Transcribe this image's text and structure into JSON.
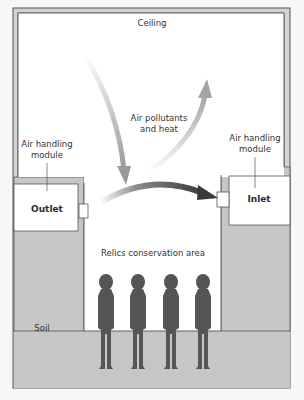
{
  "diagram": {
    "type": "cross-section",
    "labels": {
      "ceiling": "Ceiling",
      "air_flow": [
        "Air pollutants",
        "and heat"
      ],
      "left_module": [
        "Air handling",
        "module"
      ],
      "right_module": [
        "Air handling",
        "module"
      ],
      "outlet": "Outlet",
      "inlet": "Inlet",
      "conservation_area": "Relics conservation area",
      "soil": "Soil"
    },
    "figures_count": 4,
    "colors": {
      "background": "#f7f7f5",
      "soil": "#c6c6c4",
      "wall": "#d0d0ce",
      "wall_line": "#555555",
      "figure": "#555555",
      "arrow_light": "#b8b8b8",
      "arrow_dark": "#444444",
      "interior": "#ffffff"
    }
  }
}
